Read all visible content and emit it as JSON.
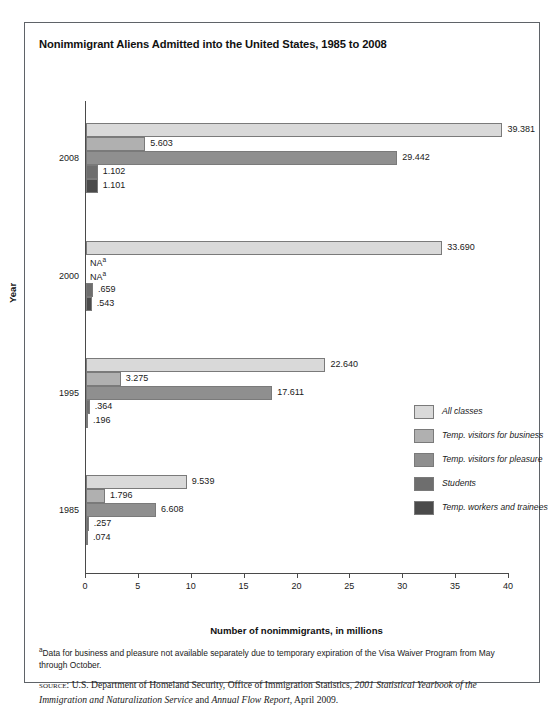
{
  "chart_title": "Nonimmigrant Aliens Admitted into the United States, 1985 to 2008",
  "axes": {
    "x_title": "Number of nonimmigrants, in millions",
    "y_title": "Year",
    "x_ticks": [
      "0",
      "5",
      "10",
      "15",
      "20",
      "25",
      "30",
      "35",
      "40"
    ]
  },
  "legend": {
    "items": [
      {
        "label": "All classes",
        "color": "#d9d9d9"
      },
      {
        "label": "Temp. visitors for business",
        "color": "#b0b0b0"
      },
      {
        "label": "Temp. visitors for pleasure",
        "color": "#8f8f8f"
      },
      {
        "label": "Students",
        "color": "#6e6e6e"
      },
      {
        "label": "Temp. workers and trainees",
        "color": "#4a4a4a"
      }
    ]
  },
  "notes": {
    "footnote_marker": "a",
    "footnote_text": "Data for business and pleasure not available separately due to temporary expiration of the Visa Waiver Program from May through October.",
    "source_label": "source:",
    "source_part1": " U.S. Department of Homeland Security, Office of Immigration Statistics, ",
    "source_italic1": "2001 Statistical Yearbook of the Immigration and Naturalization Service",
    "source_mid": " and ",
    "source_italic2": "Annual Flow Report",
    "source_part2": ", April 2009."
  },
  "chart_data": {
    "type": "bar",
    "orientation": "horizontal",
    "title": "Nonimmigrant Aliens Admitted into the United States, 1985 to 2008",
    "xlabel": "Number of nonimmigrants, in millions",
    "ylabel": "Year",
    "xlim": [
      0,
      40
    ],
    "xticks": [
      0,
      5,
      10,
      15,
      20,
      25,
      30,
      35,
      40
    ],
    "grid": false,
    "legend_position": "right-middle",
    "categories": [
      "2008",
      "2000",
      "1995",
      "1985"
    ],
    "series": [
      {
        "name": "All classes",
        "color": "#d9d9d9",
        "values": [
          39.381,
          33.69,
          22.64,
          9.539
        ],
        "labels": [
          "39.381",
          "33.690",
          "22.640",
          "9.539"
        ]
      },
      {
        "name": "Temp. visitors for business",
        "color": "#b0b0b0",
        "values": [
          5.603,
          null,
          3.275,
          1.796
        ],
        "labels": [
          "5.603",
          "NA",
          "3.275",
          "1.796"
        ]
      },
      {
        "name": "Temp. visitors for pleasure",
        "color": "#8f8f8f",
        "values": [
          29.442,
          null,
          17.611,
          6.608
        ],
        "labels": [
          "29.442",
          "NA",
          "17.611",
          "6.608"
        ]
      },
      {
        "name": "Students",
        "color": "#6e6e6e",
        "values": [
          1.102,
          0.659,
          0.364,
          0.257
        ],
        "labels": [
          "1.102",
          ".659",
          ".364",
          ".257"
        ]
      },
      {
        "name": "Temp. workers and trainees",
        "color": "#4a4a4a",
        "values": [
          1.101,
          0.543,
          0.196,
          0.074
        ],
        "labels": [
          "1.101",
          ".543",
          ".196",
          ".074"
        ]
      }
    ]
  }
}
